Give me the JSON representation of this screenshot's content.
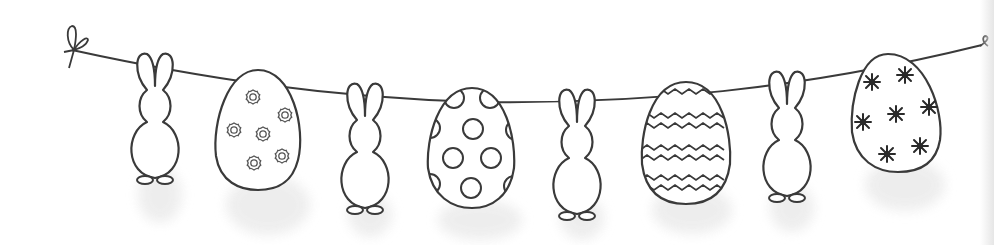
{
  "illustration": {
    "title": "Easter bunnies and eggs garland",
    "style": {
      "line_color": "#3a3a3a",
      "fill_color": "#ffffff",
      "shadow_color": "#e9e9e9",
      "background": "#ffffff"
    },
    "string": {
      "left_knot": "bow",
      "right_end": "curl"
    },
    "items": [
      {
        "type": "bunny",
        "x": 155
      },
      {
        "type": "egg",
        "x": 258,
        "pattern": "flowers",
        "pattern_count": 6
      },
      {
        "type": "bunny",
        "x": 365
      },
      {
        "type": "egg",
        "x": 472,
        "pattern": "dots",
        "pattern_count": 10
      },
      {
        "type": "bunny",
        "x": 577
      },
      {
        "type": "egg",
        "x": 686,
        "pattern": "zigzag",
        "pattern_count": 6
      },
      {
        "type": "bunny",
        "x": 787
      },
      {
        "type": "egg",
        "x": 898,
        "pattern": "stars",
        "pattern_count": 7
      }
    ]
  }
}
